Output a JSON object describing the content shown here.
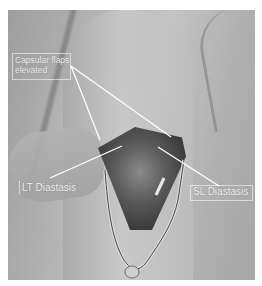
{
  "figure": {
    "background_color": "#ffffff",
    "annotations": [
      {
        "id": "capsular-flaps",
        "text_line1": "Capsular flaps",
        "text_line2": "elevated"
      },
      {
        "id": "lt-diastasis",
        "text": "LT Diastasis"
      },
      {
        "id": "sl-diastasis",
        "text": "SL Diastasis"
      }
    ],
    "colors": {
      "label_text": "#f4f4f4",
      "pointer_line": "#ffffff",
      "skin_tone": "#b8b8b8",
      "wound_dark": "#3a3a3a"
    }
  }
}
